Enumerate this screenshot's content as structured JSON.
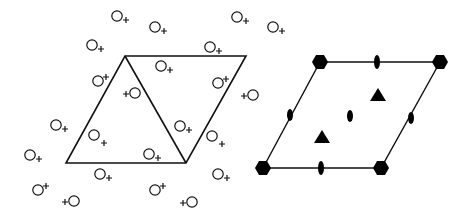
{
  "diagram": {
    "colors": {
      "line": "#111111",
      "fill": "#000000",
      "background": "#ffffff"
    },
    "left_panel": {
      "cell": [
        [
          125,
          56
        ],
        [
          246,
          56
        ],
        [
          186,
          163
        ],
        [
          66,
          163
        ]
      ],
      "diagonal": [
        [
          125,
          56
        ],
        [
          186,
          163
        ]
      ],
      "motifs": [
        {
          "cx": 117,
          "cy": 16,
          "plus": "right-down"
        },
        {
          "cx": 155,
          "cy": 27,
          "plus": "right-down"
        },
        {
          "cx": 92,
          "cy": 45,
          "plus": "right-down"
        },
        {
          "cx": 210,
          "cy": 47,
          "plus": "right-down"
        },
        {
          "cx": 237,
          "cy": 17,
          "plus": "right-down"
        },
        {
          "cx": 273,
          "cy": 27,
          "plus": "right-down"
        },
        {
          "cx": 161,
          "cy": 66,
          "plus": "right-down"
        },
        {
          "cx": 98,
          "cy": 81,
          "plus": "right-up"
        },
        {
          "cx": 218,
          "cy": 83,
          "plus": "right-up"
        },
        {
          "cx": 135,
          "cy": 93,
          "plus": "left"
        },
        {
          "cx": 253,
          "cy": 95,
          "plus": "left"
        },
        {
          "cx": 56,
          "cy": 125,
          "plus": "right-down"
        },
        {
          "cx": 94,
          "cy": 135,
          "plus": "right-down-far"
        },
        {
          "cx": 30,
          "cy": 155,
          "plus": "right-down"
        },
        {
          "cx": 180,
          "cy": 126,
          "plus": "right-down"
        },
        {
          "cx": 149,
          "cy": 154,
          "plus": "right-down"
        },
        {
          "cx": 212,
          "cy": 136,
          "plus": "right-down-far"
        },
        {
          "cx": 100,
          "cy": 174,
          "plus": "right-down"
        },
        {
          "cx": 38,
          "cy": 190,
          "plus": "right-up"
        },
        {
          "cx": 74,
          "cy": 201,
          "plus": "left"
        },
        {
          "cx": 155,
          "cy": 190,
          "plus": "right-up"
        },
        {
          "cx": 192,
          "cy": 202,
          "plus": "left"
        },
        {
          "cx": 218,
          "cy": 174,
          "plus": "right-down"
        }
      ]
    },
    "right_panel": {
      "cell": [
        [
          320,
          62
        ],
        [
          440,
          62
        ],
        [
          381,
          168
        ],
        [
          263,
          168
        ]
      ],
      "hexagons": [
        [
          320,
          62
        ],
        [
          440,
          62
        ],
        [
          381,
          168
        ],
        [
          263,
          168
        ]
      ],
      "triangles": [
        [
          378,
          95
        ],
        [
          322,
          137
        ]
      ],
      "twofold_ovals": [
        {
          "cx": 377,
          "cy": 62,
          "rx": 3,
          "ry": 7
        },
        {
          "cx": 321,
          "cy": 168,
          "rx": 3,
          "ry": 7
        },
        {
          "cx": 290,
          "cy": 115,
          "rx": 3,
          "ry": 6
        },
        {
          "cx": 350,
          "cy": 116,
          "rx": 3,
          "ry": 6
        },
        {
          "cx": 411,
          "cy": 118,
          "rx": 3,
          "ry": 6
        }
      ]
    }
  }
}
